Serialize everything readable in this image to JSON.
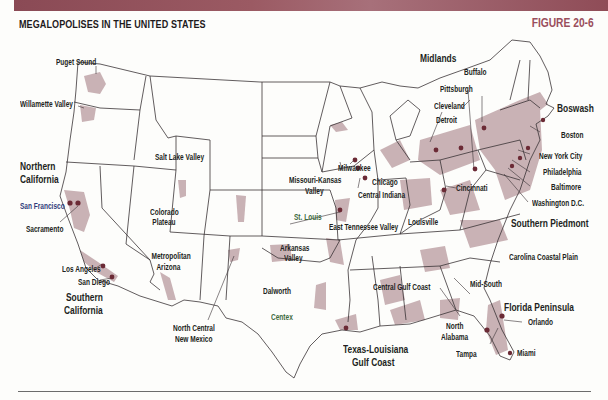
{
  "header": {
    "title": "MEGALOPOLISES IN THE UNITED STATES",
    "figure_label": "FIGURE 20-6",
    "band_color": "#8f4c57",
    "figure_color": "#9a4e5c"
  },
  "map": {
    "colors": {
      "megalopolis_fill": "#c9b2b5",
      "city_dot": "#6b2a35",
      "state_line": "#3a3336",
      "land": "#fdfdfb"
    },
    "region_labels": [
      {
        "id": "northern-california",
        "text": "Northern California"
      },
      {
        "id": "southern-california",
        "text": "Southern California"
      },
      {
        "id": "midlands",
        "text": "Midlands"
      },
      {
        "id": "boswash",
        "text": "Boswash"
      },
      {
        "id": "southern-piedmont",
        "text": "Southern Piedmont"
      },
      {
        "id": "florida-peninsula",
        "text": "Florida Peninsula"
      },
      {
        "id": "texas-louisiana-gulf-coast",
        "text": "Texas-Louisiana Gulf Coast"
      }
    ],
    "labels": {
      "puget_sound": "Puget Sound",
      "willamette_valley": "Willamette Valley",
      "northern_california_1": "Northern",
      "northern_california_2": "California",
      "san_francisco": "San Francisco",
      "sacramento": "Sacramento",
      "salt_lake_valley": "Salt Lake Valley",
      "colorado_plateau_1": "Colorado",
      "colorado_plateau_2": "Plateau",
      "metropolitan_arizona_1": "Metropolitan",
      "metropolitan_arizona_2": "Arizona",
      "los_angeles": "Los Angeles",
      "san_diego": "San Diego",
      "southern_california_1": "Southern",
      "southern_california_2": "California",
      "north_central_nm_1": "North Central",
      "north_central_nm_2": "New Mexico",
      "dalworth": "Dalworth",
      "centex": "Centex",
      "arkansas_valley_1": "Arkansas",
      "arkansas_valley_2": "Valley",
      "missouri_kansas_1": "Missouri-Kansas",
      "missouri_kansas_2": "Valley",
      "st_louis": "St. Louis",
      "milwaukee": "Milwaukee",
      "chicago": "Chicago",
      "central_indiana": "Central Indiana",
      "east_tennessee_valley": "East Tennessee Valley",
      "louisville": "Louisville",
      "cincinnati": "Cincinnati",
      "midlands": "Midlands",
      "buffalo": "Buffalo",
      "pittsburgh": "Pittsburgh",
      "cleveland": "Cleveland",
      "detroit": "Detroit",
      "boswash": "Boswash",
      "boston": "Boston",
      "new_york_city": "New York City",
      "philadelphia": "Philadelphia",
      "baltimore": "Baltimore",
      "washington_dc": "Washington D.C.",
      "southern_piedmont": "Southern Piedmont",
      "carolina_coastal_plain": "Carolina Coastal Plain",
      "central_gulf_coast": "Central Gulf Coast",
      "mid_south": "Mid-South",
      "north_alabama_1": "North",
      "north_alabama_2": "Alabama",
      "tampa": "Tampa",
      "orlando": "Orlando",
      "miami": "Miami",
      "florida_peninsula": "Florida Peninsula",
      "tx_la_gulf_1": "Texas-Louisiana",
      "tx_la_gulf_2": "Gulf Coast"
    }
  }
}
